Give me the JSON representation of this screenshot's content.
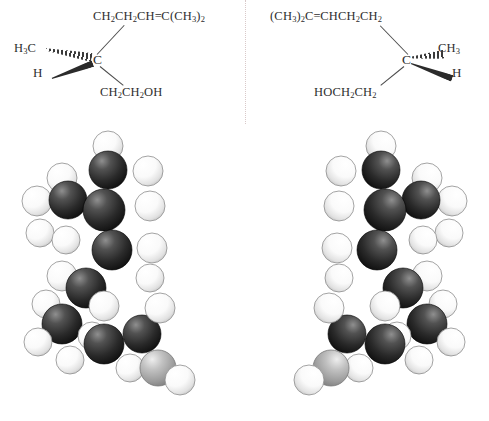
{
  "figure": {
    "type": "enantiomer-pair-diagram",
    "background_color": "#ffffff",
    "divider": {
      "style": "dotted",
      "color": "#d9c9c9"
    }
  },
  "structures": {
    "left": {
      "name": "(R)-citronellol skeletal formula",
      "top_chain": "CH2CH2CH=C(CH3)2",
      "top_chain_parts": [
        {
          "t": "CH"
        },
        {
          "sub": "2"
        },
        {
          "t": "CH"
        },
        {
          "sub": "2"
        },
        {
          "t": "CH"
        },
        {
          "t": "="
        },
        {
          "t": "C(CH"
        },
        {
          "sub": "3"
        },
        {
          "t": ")"
        },
        {
          "sub": "2"
        }
      ],
      "left_group": "H3C",
      "left_group_parts": [
        {
          "t": "H"
        },
        {
          "sub": "3"
        },
        {
          "t": "C"
        }
      ],
      "wedge_group": "H",
      "stereocenter": "C",
      "bottom_chain": "CH2CH2OH",
      "bottom_chain_parts": [
        {
          "t": "CH"
        },
        {
          "sub": "2"
        },
        {
          "t": "CH"
        },
        {
          "sub": "2"
        },
        {
          "t": "OH"
        }
      ],
      "hashed_bond_to": "H3C",
      "bold_bond_to": "H"
    },
    "right": {
      "name": "(S)-citronellol skeletal formula",
      "top_chain": "(CH3)2C=CHCH2CH2",
      "top_chain_parts": [
        {
          "t": "(CH"
        },
        {
          "sub": "3"
        },
        {
          "t": ")"
        },
        {
          "sub": "2"
        },
        {
          "t": "C"
        },
        {
          "t": "="
        },
        {
          "t": "CHCH"
        },
        {
          "sub": "2"
        },
        {
          "t": "CH"
        },
        {
          "sub": "2"
        }
      ],
      "right_group": "CH3",
      "right_group_parts": [
        {
          "t": "CH"
        },
        {
          "sub": "3"
        }
      ],
      "wedge_group": "H",
      "stereocenter": "C",
      "bottom_chain": "HOCH2CH2",
      "bottom_chain_parts": [
        {
          "t": "HOCH"
        },
        {
          "sub": "2"
        },
        {
          "t": "CH"
        },
        {
          "sub": "2"
        }
      ],
      "hashed_bond_to": "CH3",
      "bold_bond_to": "H"
    }
  },
  "models": {
    "left": {
      "name": "space-filling-model-left",
      "mirrored": false
    },
    "right": {
      "name": "space-filling-model-right",
      "mirrored": true
    },
    "atom_colors": {
      "carbon": "#242424",
      "hydrogen": "#ffffff",
      "oxygen": "#a8a8a8",
      "outline": "#555555"
    },
    "atoms_left": [
      {
        "e": "H",
        "x": 108,
        "y": 18,
        "r": 15
      },
      {
        "e": "H",
        "x": 62,
        "y": 50,
        "r": 15
      },
      {
        "e": "C",
        "x": 108,
        "y": 42,
        "r": 19
      },
      {
        "e": "H",
        "x": 148,
        "y": 43,
        "r": 15
      },
      {
        "e": "H",
        "x": 37,
        "y": 73,
        "r": 15
      },
      {
        "e": "C",
        "x": 68,
        "y": 72,
        "r": 19
      },
      {
        "e": "H",
        "x": 150,
        "y": 78,
        "r": 15
      },
      {
        "e": "H",
        "x": 40,
        "y": 105,
        "r": 14
      },
      {
        "e": "C",
        "x": 104,
        "y": 82,
        "r": 21
      },
      {
        "e": "H",
        "x": 66,
        "y": 112,
        "r": 14
      },
      {
        "e": "C",
        "x": 112,
        "y": 122,
        "r": 20
      },
      {
        "e": "H",
        "x": 152,
        "y": 120,
        "r": 15
      },
      {
        "e": "H",
        "x": 150,
        "y": 150,
        "r": 14
      },
      {
        "e": "H",
        "x": 62,
        "y": 148,
        "r": 15
      },
      {
        "e": "C",
        "x": 86,
        "y": 160,
        "r": 20
      },
      {
        "e": "H",
        "x": 46,
        "y": 176,
        "r": 14
      },
      {
        "e": "C",
        "x": 62,
        "y": 196,
        "r": 20
      },
      {
        "e": "H",
        "x": 104,
        "y": 178,
        "r": 15
      },
      {
        "e": "H",
        "x": 38,
        "y": 214,
        "r": 14
      },
      {
        "e": "H",
        "x": 92,
        "y": 208,
        "r": 14
      },
      {
        "e": "C",
        "x": 104,
        "y": 216,
        "r": 20
      },
      {
        "e": "H",
        "x": 70,
        "y": 232,
        "r": 14
      },
      {
        "e": "C",
        "x": 142,
        "y": 206,
        "r": 19
      },
      {
        "e": "H",
        "x": 160,
        "y": 180,
        "r": 15
      },
      {
        "e": "H",
        "x": 130,
        "y": 240,
        "r": 14
      },
      {
        "e": "O",
        "x": 158,
        "y": 240,
        "r": 18
      },
      {
        "e": "H",
        "x": 180,
        "y": 252,
        "r": 15
      }
    ]
  }
}
